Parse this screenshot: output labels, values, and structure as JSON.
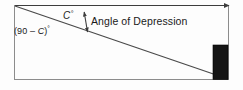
{
  "figure": {
    "kind": "geometry-diagram",
    "topic": "Angle of Depression",
    "background_color": "#fdfdfd",
    "frame_color": "#8c8c8c",
    "line_color": "#3d3d3d",
    "tower_color": "#151515",
    "text_color": "#1a1a1a"
  },
  "labels": {
    "angle_c": "C",
    "angle_c_degree_symbol": "°",
    "complement_angle_open": "(90 – ",
    "complement_angle_variable": "C",
    "complement_angle_close": ")",
    "complement_angle_degree_symbol": "°",
    "angle_of_depression": "Angle of Depression"
  },
  "elements": {
    "frame": "diagram-border",
    "horizontal_ray": "horizontal-line-of-sight-ray",
    "diagonal_ray": "line-of-sight-to-ground",
    "angle_arrow": "double-headed-angle-arrow",
    "tower": "tower-rectangle"
  },
  "geometry": {
    "frame": {
      "x": 14,
      "y": 5,
      "width": 215,
      "height": 75
    },
    "horizontal_ray": {
      "x1": 14,
      "y1": 5.5,
      "x2": 232,
      "y2": 5.5
    },
    "diagonal_ray": {
      "x1": 14.5,
      "y1": 5.5,
      "x2": 228,
      "y2": 79.5
    },
    "tower": {
      "x": 213,
      "y": 45,
      "width": 15,
      "height": 35
    },
    "angle_arrow": {
      "x1": 87,
      "y1": 33,
      "x2": 84.5,
      "y2": 11
    }
  }
}
